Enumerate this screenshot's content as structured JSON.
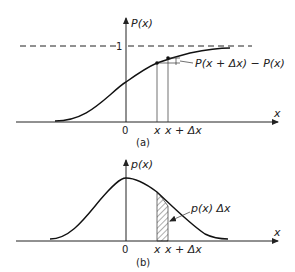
{
  "panel_a": {
    "y_label": "P(x)",
    "x_label": "x",
    "asymptote_label": "1",
    "origin_label": "0",
    "x_tick_1": "x",
    "x_tick_2": "x + Δx",
    "annotation": "P(x + Δx) − P(x)",
    "caption": "(a)"
  },
  "panel_b": {
    "y_label": "p(x)",
    "x_label": "x",
    "origin_label": "0",
    "x_tick_1": "x",
    "x_tick_2": "x + Δx",
    "annotation": "p(x) Δx",
    "caption": "(b)"
  }
}
